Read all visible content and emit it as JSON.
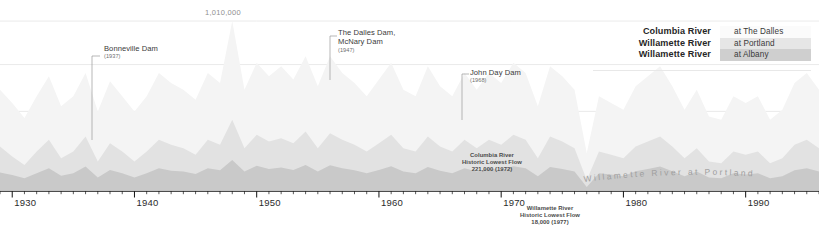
{
  "chart_data": {
    "type": "area",
    "title": "",
    "subtitle": "",
    "xlabel": "",
    "ylabel": "",
    "grid": true,
    "stacked": false,
    "xlim": [
      1929,
      1996
    ],
    "ylim": [
      0,
      1100000
    ],
    "x_tick_labels": [
      "1930",
      "1940",
      "1950",
      "1960",
      "1970",
      "1980",
      "1990"
    ],
    "x_tick_values": [
      1930,
      1940,
      1950,
      1960,
      1970,
      1980,
      1990
    ],
    "x_minor_tick_interval": 1,
    "gridline_values": [
      1010000,
      750000,
      470000,
      200000
    ],
    "labeled_gridline": {
      "value": 1010000,
      "label": "1,010,000",
      "x_year": 1948
    },
    "legend_position": "top-right",
    "series": [
      {
        "name": "Columbia River",
        "location": "at The Dalles",
        "color": "#f4f4f4",
        "x": [
          1929,
          1930,
          1931,
          1932,
          1933,
          1934,
          1935,
          1936,
          1937,
          1938,
          1939,
          1940,
          1941,
          1942,
          1943,
          1944,
          1945,
          1946,
          1947,
          1948,
          1949,
          1950,
          1951,
          1952,
          1953,
          1954,
          1955,
          1956,
          1957,
          1958,
          1959,
          1960,
          1961,
          1962,
          1963,
          1964,
          1965,
          1966,
          1967,
          1968,
          1969,
          1970,
          1971,
          1972,
          1973,
          1974,
          1975,
          1976,
          1977,
          1978,
          1979,
          1980,
          1981,
          1982,
          1983,
          1984,
          1985,
          1986,
          1987,
          1988,
          1989,
          1990,
          1991,
          1992,
          1993,
          1994,
          1995,
          1996
        ],
        "values": [
          600000,
          520000,
          430000,
          560000,
          680000,
          500000,
          560000,
          700000,
          470000,
          650000,
          560000,
          470000,
          560000,
          700000,
          640000,
          600000,
          540000,
          700000,
          640000,
          1010000,
          600000,
          760000,
          680000,
          740000,
          660000,
          800000,
          620000,
          800000,
          700000,
          640000,
          560000,
          660000,
          760000,
          600000,
          560000,
          740000,
          620000,
          560000,
          700000,
          600000,
          700000,
          640000,
          760000,
          700000,
          500000,
          740000,
          680000,
          600000,
          221000,
          560000,
          520000,
          480000,
          620000,
          680000,
          740000,
          620000,
          480000,
          600000,
          440000,
          420000,
          560000,
          520000,
          560000,
          420000,
          480000,
          640000,
          700000,
          600000
        ]
      },
      {
        "name": "Willamette River",
        "location": "at Portland",
        "color": "#e2e2e2",
        "x": [
          1929,
          1930,
          1931,
          1932,
          1933,
          1934,
          1935,
          1936,
          1937,
          1938,
          1939,
          1940,
          1941,
          1942,
          1943,
          1944,
          1945,
          1946,
          1947,
          1948,
          1949,
          1950,
          1951,
          1952,
          1953,
          1954,
          1955,
          1956,
          1957,
          1958,
          1959,
          1960,
          1961,
          1962,
          1963,
          1964,
          1965,
          1966,
          1967,
          1968,
          1969,
          1970,
          1971,
          1972,
          1973,
          1974,
          1975,
          1976,
          1977,
          1978,
          1979,
          1980,
          1981,
          1982,
          1983,
          1984,
          1985,
          1986,
          1987,
          1988,
          1989,
          1990,
          1991,
          1992,
          1993,
          1994,
          1995,
          1996
        ],
        "values": [
          260000,
          200000,
          150000,
          230000,
          300000,
          190000,
          230000,
          320000,
          170000,
          280000,
          230000,
          170000,
          230000,
          300000,
          270000,
          250000,
          210000,
          300000,
          270000,
          420000,
          250000,
          330000,
          290000,
          310000,
          280000,
          350000,
          250000,
          340000,
          300000,
          270000,
          230000,
          280000,
          330000,
          250000,
          230000,
          320000,
          260000,
          230000,
          300000,
          250000,
          300000,
          270000,
          330000,
          300000,
          190000,
          320000,
          290000,
          250000,
          60000,
          230000,
          210000,
          190000,
          260000,
          290000,
          320000,
          260000,
          190000,
          250000,
          170000,
          160000,
          230000,
          210000,
          230000,
          160000,
          190000,
          270000,
          300000,
          250000
        ]
      },
      {
        "name": "Willamette River",
        "location": "at Albany",
        "color": "#c9c9c9",
        "x": [
          1929,
          1930,
          1931,
          1932,
          1933,
          1934,
          1935,
          1936,
          1937,
          1938,
          1939,
          1940,
          1941,
          1942,
          1943,
          1944,
          1945,
          1946,
          1947,
          1948,
          1949,
          1950,
          1951,
          1952,
          1953,
          1954,
          1955,
          1956,
          1957,
          1958,
          1959,
          1960,
          1961,
          1962,
          1963,
          1964,
          1965,
          1966,
          1967,
          1968,
          1969,
          1970,
          1971,
          1972,
          1973,
          1974,
          1975,
          1976,
          1977,
          1978,
          1979,
          1980,
          1981,
          1982,
          1983,
          1984,
          1985,
          1986,
          1987,
          1988,
          1989,
          1990,
          1991,
          1992,
          1993,
          1994,
          1995,
          1996
        ],
        "values": [
          105000,
          90000,
          70000,
          100000,
          130000,
          85000,
          100000,
          140000,
          75000,
          120000,
          100000,
          75000,
          100000,
          130000,
          115000,
          110000,
          95000,
          130000,
          118000,
          180000,
          110000,
          145000,
          125000,
          135000,
          120000,
          150000,
          110000,
          148000,
          130000,
          118000,
          100000,
          120000,
          142000,
          110000,
          100000,
          138000,
          115000,
          100000,
          130000,
          110000,
          130000,
          118000,
          142000,
          130000,
          82000,
          138000,
          125000,
          110000,
          18000,
          100000,
          92000,
          82000,
          112000,
          125000,
          140000,
          112000,
          82000,
          110000,
          75000,
          70000,
          100000,
          92000,
          100000,
          70000,
          82000,
          118000,
          130000,
          110000
        ]
      }
    ],
    "annotations": [
      {
        "id": "bonneville",
        "title": "Bonneville Dam",
        "year": "(1937)",
        "x_year": 1937,
        "leader": true
      },
      {
        "id": "dalles-mcnary",
        "title": "The Dalles Dam,\nMcNary Dam",
        "year": "(1947)",
        "x_year": 1957,
        "leader": true
      },
      {
        "id": "john-day",
        "title": "John Day Dam",
        "year": "(1968)",
        "x_year": 1968,
        "leader": true
      }
    ],
    "flow_notes": [
      {
        "id": "columbia-lowest",
        "lines": [
          "Columbia River",
          "Historic Lowest Flow",
          "221,000 (1972)"
        ]
      },
      {
        "id": "willamette-lowest",
        "lines": [
          "Willamette River",
          "Historic Lowest Flow",
          "18,000 (1977)"
        ]
      }
    ],
    "inline_series_label": "Willamette River at Portland"
  },
  "grid_label": "1,010,000",
  "annotations": {
    "bonneville": {
      "title": "Bonneville Dam",
      "year": "(1937)"
    },
    "dalles": {
      "title_line1": "The Dalles Dam,",
      "title_line2": "McNary Dam",
      "year": "(1947)"
    },
    "johnday": {
      "title": "John Day Dam",
      "year": "(1968)"
    }
  },
  "flow_notes": {
    "columbia": {
      "line1": "Columbia River",
      "line2": "Historic Lowest Flow",
      "line3": "221,000 (1972)"
    },
    "willamette": {
      "line1": "Willamette River",
      "line2": "Historic Lowest Flow",
      "line3": "18,000 (1977)"
    }
  },
  "inline_label": "Willamette River at Portland",
  "legend": {
    "rows": [
      {
        "name": "Columbia River",
        "location": "at The Dalles",
        "swatch": "#fbfbfb"
      },
      {
        "name": "Willamette River",
        "location": "at Portland",
        "swatch": "#e6e6e6"
      },
      {
        "name": "Willamette River",
        "location": "at Albany",
        "swatch": "#cfcfcf"
      }
    ]
  },
  "axis": {
    "ticks": [
      {
        "label": "1930"
      },
      {
        "label": "1940"
      },
      {
        "label": "1950"
      },
      {
        "label": "1960"
      },
      {
        "label": "1970"
      },
      {
        "label": "1980"
      },
      {
        "label": "1990"
      }
    ]
  }
}
